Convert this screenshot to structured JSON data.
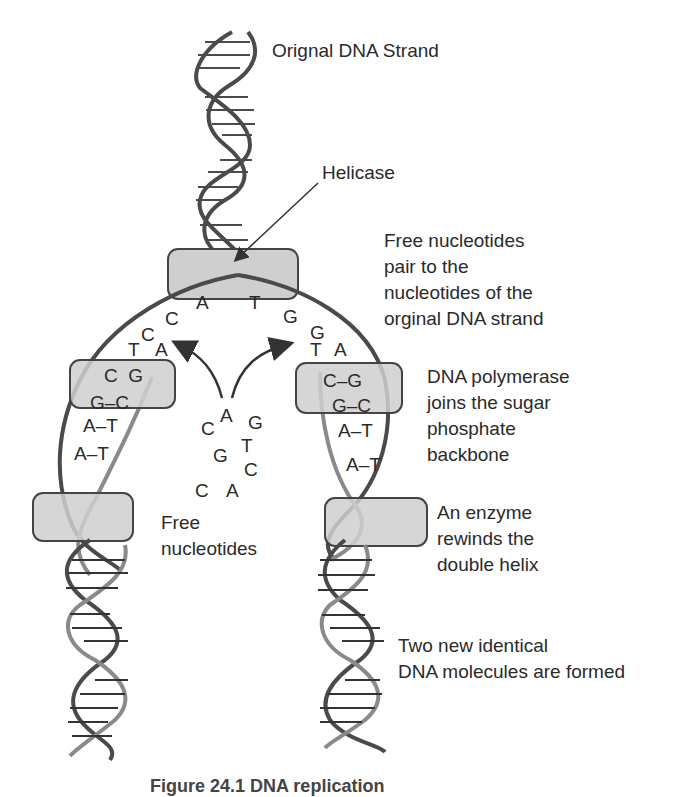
{
  "labels": {
    "original_strand": "Orignal DNA Strand",
    "helicase": "Helicase",
    "free_pair": "Free nucleotides\npair to the\nnucleotides of the\norginal DNA strand",
    "polymerase": "DNA polymerase\njoins the sugar\nphosphate\nbackbone",
    "free_nucleotides": "Free\nnucleotides",
    "rewind": "An enzyme\nrewinds the\ndouble helix",
    "two_new": "Two new identical\nDNA molecules are formed"
  },
  "caption": "Figure 24.1  DNA replication",
  "bases": {
    "top_left": "A",
    "top_right": "T",
    "left_arc": [
      "C",
      "C",
      "T",
      "A"
    ],
    "right_arc": [
      "G",
      "G",
      "T",
      "A"
    ],
    "left_pairs": [
      "C  G",
      "G–C",
      "A–T",
      "A–T"
    ],
    "right_pairs": [
      "C–G",
      "G–C",
      "A–T",
      "A–T"
    ],
    "free": [
      "A",
      "C",
      "G",
      "T",
      "G",
      "C",
      "C",
      "A"
    ]
  },
  "colors": {
    "strand_dark": "#4a4a4a",
    "strand_light": "#8a8a8a",
    "enzyme_fill": "#cfcfcf",
    "enzyme_stroke": "#444444",
    "text": "#2a2a2a"
  }
}
